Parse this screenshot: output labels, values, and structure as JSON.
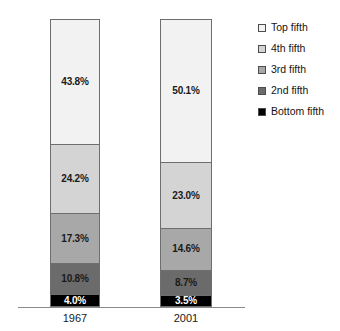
{
  "chart_data": {
    "type": "bar",
    "subtype": "stacked-100-percent",
    "title": "",
    "subtitle": "",
    "xlabel": "",
    "ylabel": "",
    "categories": [
      "1967",
      "2001"
    ],
    "ylim": [
      0,
      100
    ],
    "grid": false,
    "legend_position": "right",
    "value_suffix": "%",
    "stack_order_bottom_to_top": [
      "Bottom fifth",
      "2nd fifth",
      "3rd fifth",
      "4th fifth",
      "Top fifth"
    ],
    "series": [
      {
        "name": "Top fifth",
        "color": "#f2f2f2",
        "text_color": "#1a1a1a",
        "values": [
          43.8,
          50.1
        ],
        "labels": [
          "43.8%",
          "50.1%"
        ]
      },
      {
        "name": "4th fifth",
        "color": "#d4d4d4",
        "text_color": "#1a1a1a",
        "values": [
          24.2,
          23.0
        ],
        "labels": [
          "24.2%",
          "23.0%"
        ]
      },
      {
        "name": "3rd fifth",
        "color": "#a8a8a8",
        "text_color": "#1a1a1a",
        "values": [
          17.3,
          14.6
        ],
        "labels": [
          "17.3%",
          "14.6%"
        ]
      },
      {
        "name": "2nd fifth",
        "color": "#6b6b6b",
        "text_color": "#1a1a1a",
        "values": [
          10.8,
          8.7
        ],
        "labels": [
          "10.8%",
          "8.7%"
        ]
      },
      {
        "name": "Bottom fifth",
        "color": "#000000",
        "text_color": "#ffffff",
        "values": [
          4.0,
          3.5
        ],
        "labels": [
          "4.0%",
          "3.5%"
        ]
      }
    ]
  },
  "legend": {
    "items": [
      {
        "label": "Top fifth",
        "swatch": "#f2f2f2"
      },
      {
        "label": "4th fifth",
        "swatch": "#d4d4d4"
      },
      {
        "label": "3rd fifth",
        "swatch": "#a8a8a8"
      },
      {
        "label": "2nd fifth",
        "swatch": "#6b6b6b"
      },
      {
        "label": "Bottom fifth",
        "swatch": "#000000"
      }
    ]
  },
  "axis": {
    "tick_labels": [
      "1967",
      "2001"
    ]
  },
  "bars": {
    "b1967": {
      "category": "1967",
      "segments": [
        {
          "name": "Top fifth",
          "label": "43.8%"
        },
        {
          "name": "4th fifth",
          "label": "24.2%"
        },
        {
          "name": "3rd fifth",
          "label": "17.3%"
        },
        {
          "name": "2nd fifth",
          "label": "10.8%"
        },
        {
          "name": "Bottom fifth",
          "label": "4.0%"
        }
      ]
    },
    "b2001": {
      "category": "2001",
      "segments": [
        {
          "name": "Top fifth",
          "label": "50.1%"
        },
        {
          "name": "4th fifth",
          "label": "23.0%"
        },
        {
          "name": "3rd fifth",
          "label": "14.6%"
        },
        {
          "name": "2nd fifth",
          "label": "8.7%"
        },
        {
          "name": "Bottom fifth",
          "label": "3.5%"
        }
      ]
    }
  }
}
